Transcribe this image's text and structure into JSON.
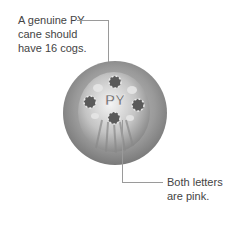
{
  "annotations": [
    {
      "id": "top",
      "lines": [
        "A genuine PY",
        "cane should",
        "have 16 cogs."
      ]
    },
    {
      "id": "bottom",
      "lines": [
        "Both letters",
        "are pink."
      ]
    }
  ],
  "image": {
    "subject": "millefiori-cane-disc",
    "letters": "PY",
    "colors": {
      "rim": "#8c8c8c",
      "body": "#bdbdbd",
      "letter": "#6e6e6e",
      "highlight": "#f2f2f2",
      "leader": "#9a9a9a"
    }
  }
}
